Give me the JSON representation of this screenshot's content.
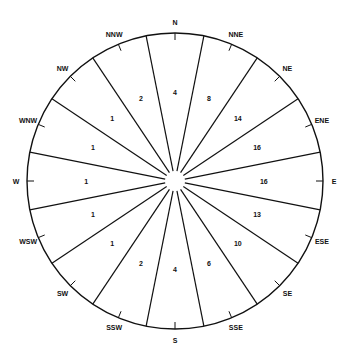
{
  "diagram": {
    "type": "wind-rose",
    "center": [
      175,
      181
    ],
    "radius": 148,
    "inner_radius": 10,
    "line_color": "#111111",
    "directions": [
      {
        "label": "N",
        "value": "4"
      },
      {
        "label": "NNE",
        "value": "8"
      },
      {
        "label": "NE",
        "value": "14"
      },
      {
        "label": "ENE",
        "value": "16"
      },
      {
        "label": "E",
        "value": "16"
      },
      {
        "label": "ESE",
        "value": "13"
      },
      {
        "label": "SE",
        "value": "10"
      },
      {
        "label": "SSE",
        "value": "6"
      },
      {
        "label": "S",
        "value": "4"
      },
      {
        "label": "SSW",
        "value": "2"
      },
      {
        "label": "SW",
        "value": "1"
      },
      {
        "label": "WSW",
        "value": "1"
      },
      {
        "label": "W",
        "value": "1"
      },
      {
        "label": "WNW",
        "value": "1"
      },
      {
        "label": "NW",
        "value": "1"
      },
      {
        "label": "NNW",
        "value": "2"
      }
    ]
  }
}
